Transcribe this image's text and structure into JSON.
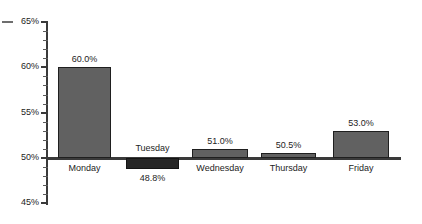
{
  "chart_data": {
    "type": "bar",
    "title": "",
    "xlabel": "",
    "ylabel": "",
    "categories": [
      "Monday",
      "Tuesday",
      "Wednesday",
      "Thursday",
      "Friday"
    ],
    "values": [
      60.0,
      48.8,
      51.0,
      50.5,
      53.0
    ],
    "value_labels": [
      "60.0%",
      "48.8%",
      "51.0%",
      "50.5%",
      "53.0%"
    ],
    "baseline": 50,
    "ylim": [
      45,
      65
    ],
    "ytick_labels": [
      "65%",
      "60%",
      "55%",
      "50%",
      "45%"
    ],
    "ytick_values": [
      65,
      60,
      55,
      50,
      45
    ],
    "minor_tick_step": 1,
    "grid": false,
    "legend": null,
    "series": [
      {
        "name": "",
        "values": [
          60.0,
          48.8,
          51.0,
          50.5,
          53.0
        ]
      }
    ],
    "colors": {
      "bar_positive": "#616161",
      "bar_negative": "#262626",
      "bar_outline": "#1f1f1f",
      "axis": "#3a3a3a",
      "text": "#1d1d1d",
      "background": "#ffffff"
    }
  },
  "axis": {
    "ticks": [
      {
        "label": "65%",
        "value": 65
      },
      {
        "label": "60%",
        "value": 60
      },
      {
        "label": "55%",
        "value": 55
      },
      {
        "label": "50%",
        "value": 50
      },
      {
        "label": "45%",
        "value": 45
      }
    ]
  },
  "bars": [
    {
      "category": "Monday",
      "value": 60.0,
      "value_label": "60.0%",
      "direction": "up"
    },
    {
      "category": "Tuesday",
      "value": 48.8,
      "value_label": "48.8%",
      "direction": "down"
    },
    {
      "category": "Wednesday",
      "value": 51.0,
      "value_label": "51.0%",
      "direction": "up"
    },
    {
      "category": "Thursday",
      "value": 50.5,
      "value_label": "50.5%",
      "direction": "up"
    },
    {
      "category": "Friday",
      "value": 53.0,
      "value_label": "53.0%",
      "direction": "up"
    }
  ]
}
